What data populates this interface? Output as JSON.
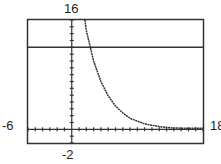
{
  "chart_data": {
    "type": "line",
    "title": "",
    "xlabel": "",
    "ylabel": "",
    "xlim": [
      -6,
      18
    ],
    "ylim": [
      -2,
      16
    ],
    "grid": false,
    "tick_labels": {
      "xmin": "-6",
      "xmax": "18",
      "ymin": "-2",
      "ymax": "16"
    },
    "series": [
      {
        "name": "exponential decay curve",
        "x": [
          1.8,
          2,
          3,
          4,
          5,
          6,
          7,
          8,
          10,
          12,
          14,
          16,
          18
        ],
        "y": [
          16,
          14.5,
          10,
          7,
          4.9,
          3.4,
          2.4,
          1.6,
          0.8,
          0.4,
          0.2,
          0.1,
          0.05
        ]
      },
      {
        "name": "horizontal line",
        "x": [
          -6,
          18
        ],
        "y": [
          12,
          12
        ]
      }
    ]
  },
  "labels": {
    "ymax": "16",
    "ymin": "-2",
    "xmin": "-6",
    "xmax": "18"
  }
}
